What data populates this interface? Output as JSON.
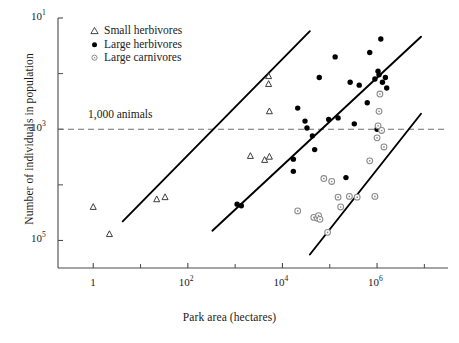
{
  "axes": {
    "x_title": "Park area (hectares)",
    "y_title": "Number of individuals in population",
    "x_tick_labels": [
      "1",
      "10",
      "10",
      "10"
    ],
    "x_tick_exponents": [
      "",
      "2",
      "4",
      "6"
    ],
    "y_tick_labels": [
      "10",
      "10",
      "10"
    ],
    "y_tick_exponents": [
      "5",
      "3",
      "1"
    ]
  },
  "legend": {
    "items": [
      {
        "label": "Small herbivores",
        "symbol": "open-triangle",
        "color": "#333333"
      },
      {
        "label": "Large herbivores",
        "symbol": "filled-circle",
        "color": "#000000"
      },
      {
        "label": "Large carnivores",
        "symbol": "open-circle",
        "color": "#8a8a8a"
      }
    ]
  },
  "annotations": {
    "threshold_label": "1,000 animals",
    "threshold_value": 1000
  },
  "chart_data": {
    "type": "scatter",
    "title": "",
    "xlabel": "Park area (hectares)",
    "ylabel": "Number of individuals in population",
    "x_scale": "log10",
    "y_scale": "log10",
    "xlim": [
      0.18,
      31600000
    ],
    "ylim": [
      3.2,
      100000
    ],
    "grid": false,
    "legend_position": "top-left-inside",
    "x_ticks": [
      1,
      100,
      10000,
      1000000
    ],
    "x_minor_ticks": [
      10,
      1000,
      100000,
      10000000
    ],
    "y_ticks": [
      10,
      1000,
      100000
    ],
    "y_minor_ticks": [
      100,
      10000
    ],
    "threshold_line": {
      "y": 1000,
      "style": "dashed",
      "label": "1,000 animals",
      "color": "#6f6f6f"
    },
    "series": [
      {
        "name": "Small herbivores",
        "marker": "open-triangle",
        "color": "#333333",
        "points": [
          [
            1.0,
            40
          ],
          [
            2.2,
            13
          ],
          [
            22,
            55
          ],
          [
            33,
            60
          ],
          [
            2100,
            330
          ],
          [
            4200,
            280
          ],
          [
            5300,
            320
          ],
          [
            5300,
            2100
          ],
          [
            5100,
            6500
          ],
          [
            5100,
            9000
          ]
        ]
      },
      {
        "name": "Large herbivores",
        "marker": "filled-circle",
        "color": "#000000",
        "points": [
          [
            1100,
            45
          ],
          [
            1350,
            42
          ],
          [
            17000,
            290
          ],
          [
            17000,
            175
          ],
          [
            21000,
            2400
          ],
          [
            30000,
            1400
          ],
          [
            33000,
            1050
          ],
          [
            43000,
            760
          ],
          [
            48000,
            430
          ],
          [
            60000,
            8500
          ],
          [
            95000,
            1500
          ],
          [
            130000,
            20000
          ],
          [
            150000,
            1600
          ],
          [
            220000,
            135
          ],
          [
            270000,
            7000
          ],
          [
            330000,
            1250
          ],
          [
            420000,
            6200
          ],
          [
            620000,
            3000
          ],
          [
            700000,
            24000
          ],
          [
            900000,
            8000
          ],
          [
            1000000,
            1000
          ],
          [
            1050000,
            11000
          ],
          [
            1100000,
            9500
          ],
          [
            1200000,
            42000
          ],
          [
            1300000,
            7000
          ],
          [
            1500000,
            8500
          ],
          [
            1600000,
            5500
          ]
        ]
      },
      {
        "name": "Large carnivores",
        "marker": "open-circle",
        "color": "#8a8a8a",
        "points": [
          [
            21000,
            34
          ],
          [
            46000,
            26
          ],
          [
            55000,
            25
          ],
          [
            58000,
            28
          ],
          [
            62000,
            24
          ],
          [
            75000,
            130
          ],
          [
            90000,
            14
          ],
          [
            110000,
            115
          ],
          [
            150000,
            60
          ],
          [
            170000,
            40
          ],
          [
            260000,
            62
          ],
          [
            380000,
            60
          ],
          [
            700000,
            270
          ],
          [
            900000,
            62
          ],
          [
            1000000,
            700
          ],
          [
            1050000,
            1150
          ],
          [
            1100000,
            2100
          ],
          [
            1150000,
            4300
          ],
          [
            1250000,
            950
          ],
          [
            1400000,
            480
          ]
        ]
      }
    ],
    "regression_lines": [
      {
        "name": "Small herbivores trend",
        "x0": 4.2,
        "y0": 22,
        "x1": 38000,
        "y1": 58000
      },
      {
        "name": "Large herbivores trend",
        "x0": 330,
        "y0": 15,
        "x1": 8500000,
        "y1": 46000
      },
      {
        "name": "Large carnivores trend",
        "x0": 38000,
        "y0": 5.6,
        "x1": 8500000,
        "y1": 1900
      }
    ]
  }
}
